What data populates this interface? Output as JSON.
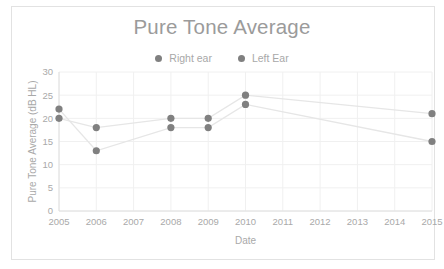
{
  "chart_data": {
    "type": "line",
    "title": "Pure Tone Average",
    "xlabel": "Date",
    "ylabel": "Pure Tone Average (dB HL)",
    "x": [
      2005,
      2006,
      2007,
      2008,
      2009,
      2010,
      2011,
      2012,
      2013,
      2014,
      2015
    ],
    "xtick_labels": [
      "2005",
      "2006",
      "2007",
      "2008",
      "2009",
      "2010",
      "2011",
      "2012",
      "2013",
      "2014",
      "2015"
    ],
    "ytick_labels": [
      "0",
      "5",
      "10",
      "15",
      "20",
      "25",
      "30"
    ],
    "yticks": [
      0,
      5,
      10,
      15,
      20,
      25,
      30
    ],
    "ylim": [
      0,
      30
    ],
    "xlim": [
      2005,
      2015
    ],
    "grid": true,
    "legend_position": "top-center",
    "series": [
      {
        "name": "Right ear",
        "color": "#808080",
        "line_color": "#e6e6e6",
        "points": [
          {
            "x": 2005,
            "y": 22
          },
          {
            "x": 2006,
            "y": 13
          },
          {
            "x": 2008,
            "y": 18
          },
          {
            "x": 2009,
            "y": 18
          },
          {
            "x": 2010,
            "y": 23
          },
          {
            "x": 2015,
            "y": 15
          }
        ]
      },
      {
        "name": "Left Ear",
        "color": "#808080",
        "line_color": "#e6e6e6",
        "points": [
          {
            "x": 2005,
            "y": 20
          },
          {
            "x": 2006,
            "y": 18
          },
          {
            "x": 2008,
            "y": 20
          },
          {
            "x": 2009,
            "y": 20
          },
          {
            "x": 2010,
            "y": 25
          },
          {
            "x": 2015,
            "y": 21
          }
        ]
      }
    ]
  },
  "legend": {
    "items": [
      {
        "label": "Right ear",
        "color": "#808080"
      },
      {
        "label": "Left Ear",
        "color": "#808080"
      }
    ]
  },
  "colors": {
    "marker": "#808080",
    "line": "#e6e6e6",
    "grid": "#f0f0f0",
    "text": "#a9a9a9",
    "title": "#9b9b9b",
    "border": "#e2e2e2"
  }
}
